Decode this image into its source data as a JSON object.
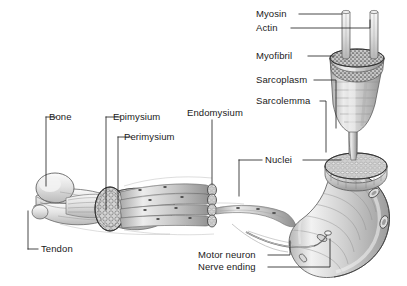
{
  "figure": {
    "background_color": "#ffffff",
    "ink_color": "#1a1a1a",
    "width": 407,
    "height": 286
  },
  "labels": {
    "myosin": "Myosin",
    "actin": "Actin",
    "myofibril": "Myofibril",
    "sarcoplasm": "Sarcoplasm",
    "sarcolemma": "Sarcolemma",
    "nuclei": "Nuclei",
    "endomysium": "Endomysium",
    "epimysium": "Epimysium",
    "perimysium": "Perimysium",
    "bone": "Bone",
    "tendon": "Tendon",
    "motor_neuron": "Motor neuron",
    "nerve_ending": "Nerve ending"
  },
  "structures": {
    "bone": "long bone with rounded head at far left",
    "tendon": "tendon attaching muscle belly to bone",
    "muscle_belly": "whole muscle with cut cross-section showing fascicles",
    "fascicle_bundle": "bundle of muscle fibers wrapped by perimysium",
    "muscle_fiber": "single curved muscle fiber with visible nuclei",
    "myofibril_bundle": "cut-away cylinder of myofibrils inside the fiber",
    "sarcomere_filaments": "thick myosin and thin actin filaments at top",
    "motor_neuron_axon": "axon running to the muscle fiber surface",
    "nerve_ending": "neuromuscular junction on the fiber"
  }
}
